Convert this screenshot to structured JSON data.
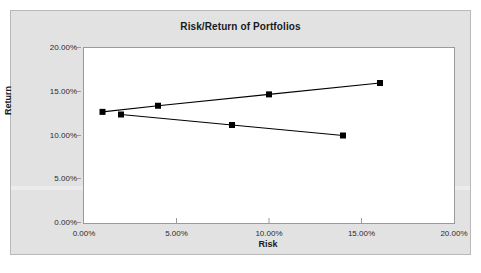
{
  "chart_data": {
    "type": "line",
    "title": "Risk/Return of Portfolios",
    "xlabel": "Risk",
    "ylabel": "Return",
    "xlim": [
      0,
      20
    ],
    "ylim": [
      0,
      20
    ],
    "grid": false,
    "legend": "none",
    "x_tick_labels": [
      "0.00%",
      "5.00%",
      "10.00%",
      "15.00%",
      "20.00%"
    ],
    "x_tick_values": [
      0,
      5,
      10,
      15,
      20
    ],
    "y_tick_labels": [
      "0.00%",
      "5.00%",
      "10.00%",
      "15.00%",
      "20.00%"
    ],
    "y_tick_values": [
      0,
      5,
      10,
      15,
      20
    ],
    "marker": "square",
    "marker_color": "#000000",
    "line_color": "#000000",
    "series": [
      {
        "name": "upper-frontier",
        "x": [
          1.0,
          4.0,
          10.0,
          16.0
        ],
        "values": [
          12.7,
          13.4,
          14.7,
          16.0
        ]
      },
      {
        "name": "lower-frontier",
        "x": [
          2.0,
          8.0,
          14.0
        ],
        "values": [
          12.4,
          11.2,
          10.0
        ]
      }
    ]
  },
  "colors": {
    "background": "#e2e2e2",
    "plot_background": "#ffffff",
    "axis": "#9a9a9a",
    "text": "#1a1a1a",
    "series": "#000000"
  }
}
